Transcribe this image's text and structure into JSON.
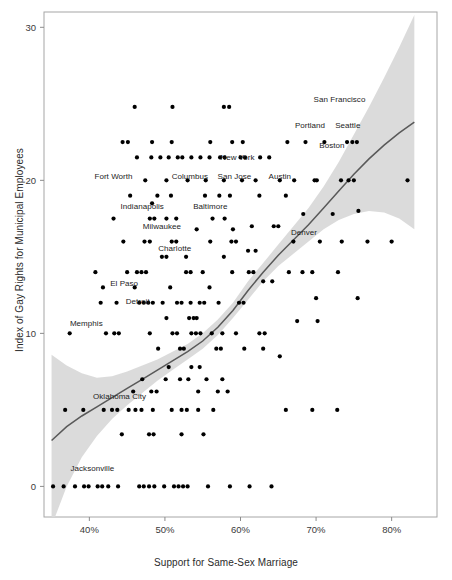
{
  "chart_data": {
    "type": "scatter",
    "title": "",
    "xlabel": "Support for Same-Sex Marriage",
    "ylabel": "Index of Gay Rights for Municipal Employees",
    "xlim": [
      34,
      86
    ],
    "ylim": [
      -2,
      31
    ],
    "xticks": [
      40,
      50,
      60,
      70,
      80
    ],
    "xticklabels": [
      "40%",
      "50%",
      "60%",
      "70%",
      "80%"
    ],
    "yticks": [
      0,
      10,
      20,
      30
    ],
    "yticklabels": [
      "0",
      "10",
      "20",
      "30"
    ],
    "grid": false,
    "legend": false,
    "smoother": {
      "type": "loess-with-confidence-band",
      "line_color": "#595959",
      "band_color": "#d9d9d9",
      "fit_x": [
        35.0,
        37.0,
        39.0,
        41.0,
        43.0,
        45.0,
        47.0,
        49.0,
        51.0,
        53.0,
        55.0,
        57.0,
        59.0,
        61.0,
        63.0,
        65.0,
        67.0,
        69.0,
        71.0,
        73.0,
        75.0,
        77.0,
        79.0,
        81.0,
        83.0
      ],
      "fit_y": [
        3.0,
        3.9,
        4.6,
        5.2,
        5.8,
        6.4,
        7.0,
        7.6,
        8.2,
        8.8,
        9.5,
        10.4,
        11.5,
        12.8,
        14.0,
        15.1,
        16.1,
        17.1,
        18.2,
        19.3,
        20.4,
        21.4,
        22.3,
        23.1,
        23.8
      ],
      "band_lo": [
        -2.6,
        0.0,
        1.9,
        3.3,
        4.4,
        5.3,
        6.1,
        6.9,
        7.6,
        8.3,
        9.0,
        9.9,
        11.0,
        12.2,
        13.4,
        14.4,
        15.2,
        16.0,
        16.8,
        17.4,
        17.8,
        18.0,
        17.9,
        17.5,
        16.8
      ],
      "band_hi": [
        8.6,
        7.9,
        7.4,
        7.1,
        7.2,
        7.5,
        7.9,
        8.3,
        8.8,
        9.3,
        10.0,
        10.9,
        12.0,
        13.4,
        14.6,
        15.8,
        17.0,
        18.2,
        19.6,
        21.2,
        23.0,
        24.8,
        26.7,
        28.7,
        30.8
      ]
    },
    "points": [
      [
        35.2,
        0
      ],
      [
        36.6,
        0
      ],
      [
        38.1,
        0
      ],
      [
        39.3,
        0
      ],
      [
        39.9,
        0
      ],
      [
        41.1,
        0
      ],
      [
        41.7,
        0
      ],
      [
        42.5,
        0
      ],
      [
        43.8,
        0
      ],
      [
        46.6,
        0
      ],
      [
        47.2,
        0
      ],
      [
        47.9,
        0
      ],
      [
        48.6,
        0
      ],
      [
        49.9,
        0
      ],
      [
        51.2,
        0
      ],
      [
        51.8,
        0
      ],
      [
        52.4,
        0
      ],
      [
        53.0,
        0
      ],
      [
        55.7,
        0
      ],
      [
        58.6,
        0
      ],
      [
        61.2,
        0
      ],
      [
        64.1,
        0
      ],
      [
        36.8,
        5
      ],
      [
        39.2,
        5
      ],
      [
        41.9,
        5
      ],
      [
        43.0,
        5
      ],
      [
        43.7,
        5
      ],
      [
        45.2,
        5
      ],
      [
        46.1,
        5
      ],
      [
        46.9,
        5
      ],
      [
        48.4,
        5
      ],
      [
        50.9,
        5
      ],
      [
        52.2,
        5
      ],
      [
        52.9,
        5
      ],
      [
        54.4,
        5
      ],
      [
        56.4,
        5
      ],
      [
        44.3,
        3.4
      ],
      [
        47.9,
        3.4
      ],
      [
        48.5,
        3.4
      ],
      [
        52.2,
        3.4
      ],
      [
        55.1,
        3.4
      ],
      [
        45.8,
        6.2
      ],
      [
        48.2,
        6.2
      ],
      [
        48.9,
        6.2
      ],
      [
        54.4,
        6.2
      ],
      [
        57.0,
        6.2
      ],
      [
        58.3,
        6.2
      ],
      [
        47.0,
        7.0
      ],
      [
        50.1,
        7.0
      ],
      [
        52.0,
        7.0
      ],
      [
        53.1,
        7.0
      ],
      [
        55.5,
        7.0
      ],
      [
        57.6,
        7.0
      ],
      [
        50.5,
        7.8
      ],
      [
        53.5,
        7.8
      ],
      [
        54.6,
        7.8
      ],
      [
        37.4,
        10
      ],
      [
        42.2,
        10
      ],
      [
        43.3,
        10
      ],
      [
        43.9,
        10
      ],
      [
        48.0,
        10
      ],
      [
        51.0,
        10
      ],
      [
        51.6,
        10
      ],
      [
        53.5,
        10
      ],
      [
        54.1,
        10
      ],
      [
        54.7,
        10
      ],
      [
        56.2,
        10
      ],
      [
        57.6,
        10
      ],
      [
        59.4,
        10
      ],
      [
        62.5,
        10
      ],
      [
        63.2,
        10
      ],
      [
        49.1,
        9.0
      ],
      [
        52.0,
        9.0
      ],
      [
        52.5,
        9.0
      ],
      [
        56.8,
        9.0
      ],
      [
        57.4,
        9.0
      ],
      [
        60.5,
        9.0
      ],
      [
        63.0,
        9.0
      ],
      [
        50.2,
        11.0
      ],
      [
        53.2,
        11.0
      ],
      [
        53.8,
        11.0
      ],
      [
        54.2,
        11.0
      ],
      [
        41.5,
        12
      ],
      [
        43.6,
        12
      ],
      [
        46.6,
        12
      ],
      [
        47.2,
        12
      ],
      [
        47.8,
        12
      ],
      [
        48.4,
        12
      ],
      [
        49.7,
        12
      ],
      [
        51.6,
        12
      ],
      [
        52.2,
        12
      ],
      [
        53.4,
        12
      ],
      [
        54.6,
        12
      ],
      [
        55.2,
        12
      ],
      [
        57.1,
        12
      ],
      [
        59.8,
        12
      ],
      [
        60.4,
        12
      ],
      [
        41.8,
        13
      ],
      [
        46.0,
        13
      ],
      [
        50.7,
        13
      ],
      [
        55.9,
        13
      ],
      [
        40.8,
        14
      ],
      [
        45.0,
        14
      ],
      [
        46.3,
        14
      ],
      [
        46.9,
        14
      ],
      [
        47.5,
        14
      ],
      [
        52.8,
        14
      ],
      [
        53.4,
        14
      ],
      [
        55.0,
        14
      ],
      [
        58.9,
        14
      ],
      [
        61.1,
        14
      ],
      [
        61.7,
        14
      ],
      [
        49.6,
        15
      ],
      [
        50.2,
        15
      ],
      [
        52.8,
        15
      ],
      [
        57.8,
        15
      ],
      [
        44.5,
        16
      ],
      [
        47.3,
        16
      ],
      [
        48.0,
        16
      ],
      [
        50.9,
        16
      ],
      [
        51.5,
        16
      ],
      [
        56.0,
        16
      ],
      [
        58.8,
        16
      ],
      [
        59.4,
        16
      ],
      [
        54.2,
        16.8
      ],
      [
        59.0,
        16.8
      ],
      [
        43.2,
        17.5
      ],
      [
        48.0,
        17.5
      ],
      [
        48.6,
        17.5
      ],
      [
        50.2,
        17.5
      ],
      [
        51.5,
        17.5
      ],
      [
        56.3,
        17.5
      ],
      [
        57.9,
        17.5
      ],
      [
        48.3,
        18.5
      ],
      [
        45.4,
        19
      ],
      [
        49.0,
        19
      ],
      [
        50.8,
        19
      ],
      [
        55.3,
        19
      ],
      [
        57.2,
        19
      ],
      [
        58.6,
        19
      ],
      [
        62.5,
        19
      ],
      [
        66.0,
        19
      ],
      [
        47.4,
        20
      ],
      [
        50.2,
        20
      ],
      [
        53.0,
        20
      ],
      [
        55.4,
        20
      ],
      [
        57.8,
        20
      ],
      [
        60.2,
        20
      ],
      [
        62.0,
        20
      ],
      [
        65.2,
        20
      ],
      [
        70.1,
        20
      ],
      [
        74.3,
        20
      ],
      [
        82.1,
        20
      ],
      [
        46.3,
        21.5
      ],
      [
        48.2,
        21.5
      ],
      [
        49.4,
        21.5
      ],
      [
        50.5,
        21.5
      ],
      [
        51.7,
        21.5
      ],
      [
        52.3,
        21.5
      ],
      [
        53.5,
        21.5
      ],
      [
        54.7,
        21.5
      ],
      [
        55.9,
        21.5
      ],
      [
        57.3,
        21.5
      ],
      [
        57.9,
        21.5
      ],
      [
        60.0,
        21.5
      ],
      [
        60.6,
        21.5
      ],
      [
        62.6,
        21.5
      ],
      [
        63.8,
        21.5
      ],
      [
        44.4,
        22.5
      ],
      [
        45.1,
        22.5
      ],
      [
        48.3,
        22.5
      ],
      [
        50.9,
        22.5
      ],
      [
        56.0,
        22.5
      ],
      [
        58.9,
        22.5
      ],
      [
        60.3,
        22.5
      ],
      [
        46.0,
        24.8
      ],
      [
        51.0,
        24.8
      ],
      [
        57.8,
        24.8
      ],
      [
        58.5,
        24.8
      ],
      [
        66.2,
        22.5
      ],
      [
        68.6,
        22.5
      ],
      [
        71.1,
        22.5
      ],
      [
        74.1,
        22.5
      ],
      [
        74.8,
        22.5
      ],
      [
        75.4,
        22.5
      ],
      [
        67.1,
        20.0
      ],
      [
        69.8,
        20.0
      ],
      [
        73.3,
        20.0
      ],
      [
        75.0,
        20.0
      ],
      [
        68.3,
        17.8
      ],
      [
        72.2,
        17.8
      ],
      [
        75.6,
        18.0
      ],
      [
        67.0,
        16.0
      ],
      [
        70.5,
        16.0
      ],
      [
        73.4,
        16.0
      ],
      [
        76.8,
        16.0
      ],
      [
        80.0,
        16.0
      ],
      [
        66.4,
        14.0
      ],
      [
        68.2,
        14.0
      ],
      [
        69.5,
        14.0
      ],
      [
        72.9,
        14.0
      ],
      [
        70.0,
        12.3
      ],
      [
        75.5,
        12.3
      ],
      [
        67.5,
        10.8
      ],
      [
        70.2,
        10.8
      ],
      [
        65.2,
        8.5
      ],
      [
        66.0,
        5.0
      ],
      [
        69.5,
        5.0
      ],
      [
        72.8,
        5.0
      ],
      [
        63.0,
        13.4
      ],
      [
        64.2,
        13.4
      ],
      [
        61.5,
        17.0
      ],
      [
        64.4,
        17.0
      ],
      [
        65.0,
        17.0
      ],
      [
        61.0,
        15.4
      ],
      [
        62.0,
        15.4
      ]
    ],
    "annotations": [
      {
        "label": "San Francisco",
        "x": 73.1,
        "y": 25.3
      },
      {
        "label": "Portland",
        "x": 69.2,
        "y": 23.6
      },
      {
        "label": "Seattle",
        "x": 74.2,
        "y": 23.6
      },
      {
        "label": "Boston",
        "x": 72.1,
        "y": 22.3
      },
      {
        "label": "New York",
        "x": 59.6,
        "y": 21.5
      },
      {
        "label": "Austin",
        "x": 65.2,
        "y": 20.3
      },
      {
        "label": "Columbus",
        "x": 53.3,
        "y": 20.3
      },
      {
        "label": "San Jose",
        "x": 59.2,
        "y": 20.3
      },
      {
        "label": "Fort Worth",
        "x": 43.2,
        "y": 20.3
      },
      {
        "label": "Baltimore",
        "x": 56.0,
        "y": 18.3
      },
      {
        "label": "Indianapolis",
        "x": 47.0,
        "y": 18.3
      },
      {
        "label": "Milwaukee",
        "x": 49.6,
        "y": 17.0
      },
      {
        "label": "Charlotte",
        "x": 51.3,
        "y": 15.6
      },
      {
        "label": "Denver",
        "x": 68.4,
        "y": 16.6
      },
      {
        "label": "El Paso",
        "x": 44.6,
        "y": 13.3
      },
      {
        "label": "Detroit",
        "x": 46.4,
        "y": 12.1
      },
      {
        "label": "Memphis",
        "x": 39.6,
        "y": 10.7
      },
      {
        "label": "Oklahoma City",
        "x": 44.0,
        "y": 5.9
      },
      {
        "label": "Jacksonville",
        "x": 40.4,
        "y": 1.2
      }
    ]
  },
  "panel": {
    "background": "#ffffff",
    "border_color": "#a6a6a6",
    "point_color": "#000000"
  }
}
